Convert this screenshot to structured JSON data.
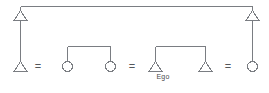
{
  "diagram": {
    "type": "genealogical-kinship-chart",
    "colors": {
      "line": "#7a7d82",
      "background": "#ffffff",
      "text": "#4a4a4a"
    },
    "labels": {
      "ego": "Ego",
      "marriage_symbol": "="
    },
    "marriage_symbols": [
      {
        "id": "marriage-1",
        "text": "="
      },
      {
        "id": "marriage-2",
        "text": "="
      },
      {
        "id": "marriage-3",
        "text": "="
      }
    ],
    "nodes": [
      {
        "id": "top-left-male",
        "shape": "triangle",
        "sex": "male",
        "generation": 1,
        "label": ""
      },
      {
        "id": "top-right-male",
        "shape": "triangle",
        "sex": "male",
        "generation": 1,
        "label": ""
      },
      {
        "id": "bottom-male-1",
        "shape": "triangle",
        "sex": "male",
        "generation": 2,
        "label": ""
      },
      {
        "id": "bottom-female-1",
        "shape": "circle",
        "sex": "female",
        "generation": 2,
        "label": ""
      },
      {
        "id": "bottom-female-2",
        "shape": "circle",
        "sex": "female",
        "generation": 2,
        "label": ""
      },
      {
        "id": "bottom-male-ego",
        "shape": "triangle",
        "sex": "male",
        "generation": 2,
        "label": "Ego"
      },
      {
        "id": "bottom-male-2",
        "shape": "triangle",
        "sex": "male",
        "generation": 2,
        "label": ""
      },
      {
        "id": "bottom-female-3",
        "shape": "circle",
        "sex": "female",
        "generation": 2,
        "label": ""
      }
    ],
    "links": [
      {
        "id": "top-sibling-bar",
        "kind": "sibling-bar",
        "from": "top-left-male",
        "to": "top-right-male"
      },
      {
        "id": "descent-left",
        "kind": "descent-line",
        "from": "top-left-male",
        "to": "bottom-male-1"
      },
      {
        "id": "descent-right",
        "kind": "descent-line",
        "from": "top-right-male",
        "to": "bottom-female-3"
      },
      {
        "id": "sibling-bar-left",
        "kind": "sibling-bar",
        "from": "bottom-female-1",
        "to": "bottom-female-2"
      },
      {
        "id": "sibling-bar-right",
        "kind": "sibling-bar",
        "from": "bottom-male-ego",
        "to": "bottom-male-2"
      },
      {
        "id": "marriage-link-1",
        "kind": "marriage",
        "from": "bottom-male-1",
        "to": "bottom-female-1"
      },
      {
        "id": "marriage-link-2",
        "kind": "marriage",
        "from": "bottom-female-2",
        "to": "bottom-male-ego"
      },
      {
        "id": "marriage-link-3",
        "kind": "marriage",
        "from": "bottom-male-2",
        "to": "bottom-female-3"
      }
    ]
  }
}
